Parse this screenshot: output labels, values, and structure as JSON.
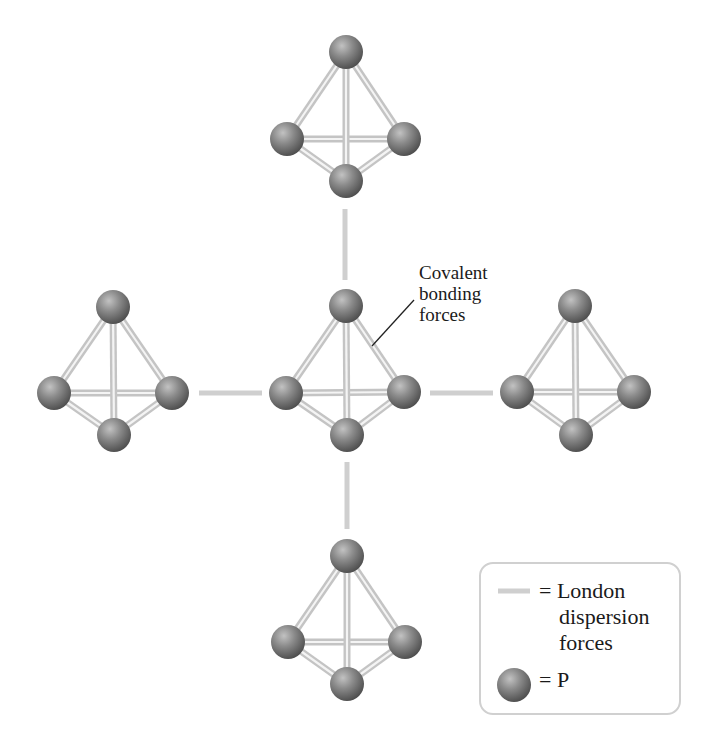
{
  "diagram": {
    "title": "",
    "colors": {
      "atom_highlight": "#b5b5b5",
      "atom_mid": "#808080",
      "atom_edge": "#555555",
      "bond": "#c4c4c4",
      "dispersion": "#cfcfcf",
      "text": "#1a1a1a",
      "legend_border": "#d0d0d0"
    },
    "atom_radius": 17,
    "molecules": [
      {
        "name": "top",
        "atoms": [
          [
            346,
            52
          ],
          [
            287,
            139
          ],
          [
            404,
            139
          ],
          [
            346,
            181
          ]
        ]
      },
      {
        "name": "left",
        "atoms": [
          [
            113,
            307
          ],
          [
            54,
            393
          ],
          [
            172,
            393
          ],
          [
            114,
            435
          ]
        ]
      },
      {
        "name": "center",
        "atoms": [
          [
            346,
            306
          ],
          [
            286,
            393
          ],
          [
            404,
            392
          ],
          [
            347,
            435
          ]
        ]
      },
      {
        "name": "right",
        "atoms": [
          [
            575,
            306
          ],
          [
            517,
            392
          ],
          [
            634,
            392
          ],
          [
            576,
            435
          ]
        ]
      },
      {
        "name": "bottom",
        "atoms": [
          [
            347,
            556
          ],
          [
            288,
            642
          ],
          [
            405,
            642
          ],
          [
            347,
            684
          ]
        ]
      }
    ],
    "dispersion_lines": [
      {
        "name": "top-center",
        "x1": 345,
        "y1": 209,
        "x2": 345,
        "y2": 280
      },
      {
        "name": "center-bottom",
        "x1": 347,
        "y1": 462,
        "x2": 347,
        "y2": 529
      },
      {
        "name": "left-center",
        "x1": 199,
        "y1": 393,
        "x2": 262,
        "y2": 393
      },
      {
        "name": "center-right",
        "x1": 430,
        "y1": 393,
        "x2": 493,
        "y2": 393
      }
    ],
    "annotation": {
      "lines": [
        "Covalent",
        "bonding",
        "forces"
      ],
      "leader": {
        "x1": 372,
        "y1": 346,
        "x2": 414,
        "y2": 300
      }
    },
    "legend": {
      "dispersion_label_lines": [
        "= London",
        "dispersion",
        "forces"
      ],
      "atom_label": "= P"
    }
  }
}
